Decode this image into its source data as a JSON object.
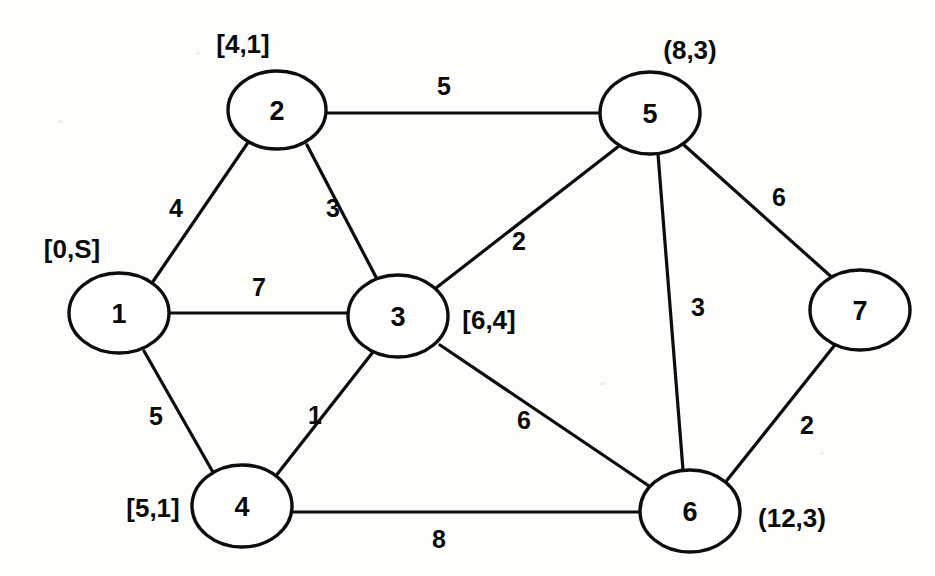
{
  "figure": {
    "type": "weighted-undirected-graph",
    "title": "",
    "background_color": "#fdfdfc",
    "stroke_color": "#0d0d0d"
  },
  "nodes": [
    {
      "id": "1",
      "label": "1",
      "cx": 119,
      "cy": 313,
      "rx": 50,
      "ry": 40,
      "annotation": "[0,S]",
      "annotation_x": 72,
      "annotation_y": 249
    },
    {
      "id": "2",
      "label": "2",
      "cx": 277,
      "cy": 110,
      "rx": 49,
      "ry": 39,
      "annotation": "[4,1]",
      "annotation_x": 243,
      "annotation_y": 44
    },
    {
      "id": "3",
      "label": "3",
      "cx": 398,
      "cy": 316,
      "rx": 50,
      "ry": 41,
      "annotation": "[6,4]",
      "annotation_x": 489,
      "annotation_y": 320
    },
    {
      "id": "4",
      "label": "4",
      "cx": 242,
      "cy": 506,
      "rx": 50,
      "ry": 41,
      "annotation": "[5,1]",
      "annotation_x": 153,
      "annotation_y": 508
    },
    {
      "id": "5",
      "label": "5",
      "cx": 650,
      "cy": 113,
      "rx": 50,
      "ry": 41,
      "annotation": "(8,3)",
      "annotation_x": 690,
      "annotation_y": 50
    },
    {
      "id": "6",
      "label": "6",
      "cx": 690,
      "cy": 511,
      "rx": 50,
      "ry": 41,
      "annotation": "(12,3)",
      "annotation_x": 792,
      "annotation_y": 518
    },
    {
      "id": "7",
      "label": "7",
      "cx": 860,
      "cy": 310,
      "rx": 50,
      "ry": 40,
      "annotation": "",
      "annotation_x": 0,
      "annotation_y": 0
    }
  ],
  "edges": [
    {
      "from": "1",
      "to": "2",
      "weight": "4",
      "x1": 152,
      "y1": 283,
      "x2": 249,
      "y2": 141,
      "label_x": 176,
      "label_y": 208
    },
    {
      "from": "1",
      "to": "3",
      "weight": "7",
      "x1": 169,
      "y1": 313,
      "x2": 348,
      "y2": 313,
      "label_x": 259,
      "label_y": 287
    },
    {
      "from": "1",
      "to": "4",
      "weight": "5",
      "x1": 144,
      "y1": 351,
      "x2": 214,
      "y2": 474,
      "label_x": 156,
      "label_y": 416
    },
    {
      "from": "2",
      "to": "3",
      "weight": "3",
      "x1": 307,
      "y1": 145,
      "x2": 377,
      "y2": 279,
      "label_x": 333,
      "label_y": 208
    },
    {
      "from": "2",
      "to": "5",
      "weight": "5",
      "x1": 326,
      "y1": 113,
      "x2": 600,
      "y2": 113,
      "label_x": 444,
      "label_y": 86
    },
    {
      "from": "3",
      "to": "5",
      "weight": "2",
      "x1": 436,
      "y1": 288,
      "x2": 619,
      "y2": 146,
      "label_x": 519,
      "label_y": 241
    },
    {
      "from": "3",
      "to": "4",
      "weight": "1",
      "x1": 373,
      "y1": 352,
      "x2": 275,
      "y2": 477,
      "label_x": 315,
      "label_y": 415
    },
    {
      "from": "3",
      "to": "6",
      "weight": "6",
      "x1": 440,
      "y1": 345,
      "x2": 649,
      "y2": 486,
      "label_x": 524,
      "label_y": 420
    },
    {
      "from": "5",
      "to": "6",
      "weight": "3",
      "x1": 658,
      "y1": 154,
      "x2": 683,
      "y2": 470,
      "label_x": 698,
      "label_y": 307
    },
    {
      "from": "5",
      "to": "7",
      "weight": "6",
      "x1": 684,
      "y1": 145,
      "x2": 836,
      "y2": 281,
      "label_x": 779,
      "label_y": 197
    },
    {
      "from": "4",
      "to": "6",
      "weight": "8",
      "x1": 292,
      "y1": 512,
      "x2": 640,
      "y2": 512,
      "label_x": 439,
      "label_y": 539
    },
    {
      "from": "6",
      "to": "7",
      "weight": "2",
      "x1": 724,
      "y1": 484,
      "x2": 838,
      "y2": 341,
      "label_x": 807,
      "label_y": 425
    }
  ],
  "chart_data": {
    "type": "diagram",
    "title": "",
    "nodes": [
      "1",
      "2",
      "3",
      "4",
      "5",
      "6",
      "7"
    ],
    "node_annotations": {
      "1": "[0,S]",
      "2": "[4,1]",
      "3": "[6,4]",
      "4": "[5,1]",
      "5": "(8,3)",
      "6": "(12,3)",
      "7": ""
    },
    "edges": [
      {
        "u": "1",
        "v": "2",
        "w": 4
      },
      {
        "u": "1",
        "v": "3",
        "w": 7
      },
      {
        "u": "1",
        "v": "4",
        "w": 5
      },
      {
        "u": "2",
        "v": "3",
        "w": 3
      },
      {
        "u": "2",
        "v": "5",
        "w": 5
      },
      {
        "u": "3",
        "v": "5",
        "w": 2
      },
      {
        "u": "3",
        "v": "4",
        "w": 1
      },
      {
        "u": "3",
        "v": "6",
        "w": 6
      },
      {
        "u": "5",
        "v": "6",
        "w": 3
      },
      {
        "u": "5",
        "v": "7",
        "w": 6
      },
      {
        "u": "4",
        "v": "6",
        "w": 8
      },
      {
        "u": "6",
        "v": "7",
        "w": 2
      }
    ]
  }
}
